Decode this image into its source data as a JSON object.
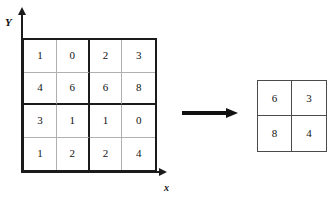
{
  "chart_data": {
    "type": "table",
    "title": "",
    "axes": {
      "x_label": "x",
      "y_label": "Y"
    },
    "input_grid": {
      "name": "input-feature-map",
      "rows": 4,
      "cols": 4,
      "pool_size": 2,
      "values": [
        [
          1,
          0,
          2,
          3
        ],
        [
          4,
          6,
          6,
          8
        ],
        [
          3,
          1,
          1,
          0
        ],
        [
          1,
          2,
          2,
          4
        ]
      ]
    },
    "output_grid": {
      "name": "output-feature-map",
      "rows": 2,
      "cols": 2,
      "values": [
        [
          6,
          3
        ],
        [
          8,
          4
        ]
      ]
    },
    "operator": {
      "symbol": "→",
      "label": ""
    }
  },
  "figure": {
    "axis_y_label": "Y",
    "axis_x_label": "x",
    "input": {
      "r0": {
        "c0": "1",
        "c1": "0",
        "c2": "2",
        "c3": "3"
      },
      "r1": {
        "c0": "4",
        "c1": "6",
        "c2": "6",
        "c3": "8"
      },
      "r2": {
        "c0": "3",
        "c1": "1",
        "c2": "1",
        "c3": "0"
      },
      "r3": {
        "c0": "1",
        "c1": "2",
        "c2": "2",
        "c3": "4"
      }
    },
    "output": {
      "r0": {
        "c0": "6",
        "c1": "3"
      },
      "r1": {
        "c0": "8",
        "c1": "4"
      }
    }
  },
  "colors": {
    "stroke_dark": "#1b1b1b",
    "stroke_light": "#b0b0b0",
    "stroke_output": "#4a4a4a",
    "text": "#111111",
    "background": "#ffffff"
  }
}
